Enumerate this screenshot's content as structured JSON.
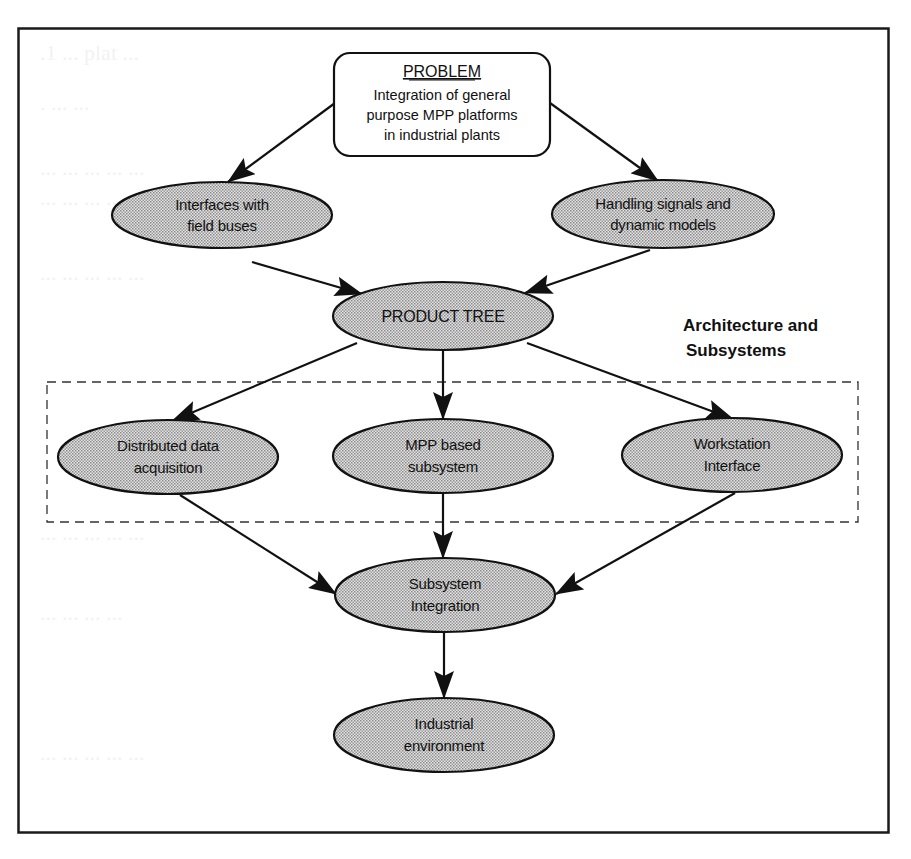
{
  "figure": {
    "frame": {
      "x": 18,
      "y": 28,
      "width": 871,
      "height": 805,
      "stroke": "#1a1a1a"
    },
    "colors": {
      "node_fill": "#c9c9c9",
      "node_stroke": "#111111",
      "arrow": "#111111",
      "dashed_group": "#333333",
      "background": "#ffffff"
    },
    "problem_box": {
      "title": "PROBLEM",
      "lines": [
        "Integration of general",
        "purpose MPP platforms",
        "in industrial plants"
      ]
    },
    "nodes": [
      {
        "id": "interfaces",
        "lines": [
          "Interfaces with",
          "field buses"
        ]
      },
      {
        "id": "handling",
        "lines": [
          "Handling signals and",
          "dynamic models"
        ]
      },
      {
        "id": "product_tree",
        "lines": [
          "PRODUCT TREE"
        ]
      },
      {
        "id": "distributed",
        "lines": [
          "Distributed data",
          "acquisition"
        ]
      },
      {
        "id": "mpp",
        "lines": [
          "MPP based",
          "subsystem"
        ]
      },
      {
        "id": "workstation",
        "lines": [
          "Workstation",
          "Interface"
        ]
      },
      {
        "id": "integration",
        "lines": [
          "Subsystem",
          "Integration"
        ]
      },
      {
        "id": "industrial",
        "lines": [
          "Industrial",
          "environment"
        ]
      }
    ],
    "group": {
      "label_lines": [
        "Architecture and",
        "Subsystems"
      ]
    },
    "edges": [
      {
        "from": "problem",
        "to": "interfaces"
      },
      {
        "from": "problem",
        "to": "handling"
      },
      {
        "from": "interfaces",
        "to": "product_tree"
      },
      {
        "from": "handling",
        "to": "product_tree"
      },
      {
        "from": "product_tree",
        "to": "distributed"
      },
      {
        "from": "product_tree",
        "to": "mpp"
      },
      {
        "from": "product_tree",
        "to": "workstation"
      },
      {
        "from": "distributed",
        "to": "integration"
      },
      {
        "from": "mpp",
        "to": "integration"
      },
      {
        "from": "workstation",
        "to": "integration"
      },
      {
        "from": "integration",
        "to": "industrial"
      }
    ]
  }
}
